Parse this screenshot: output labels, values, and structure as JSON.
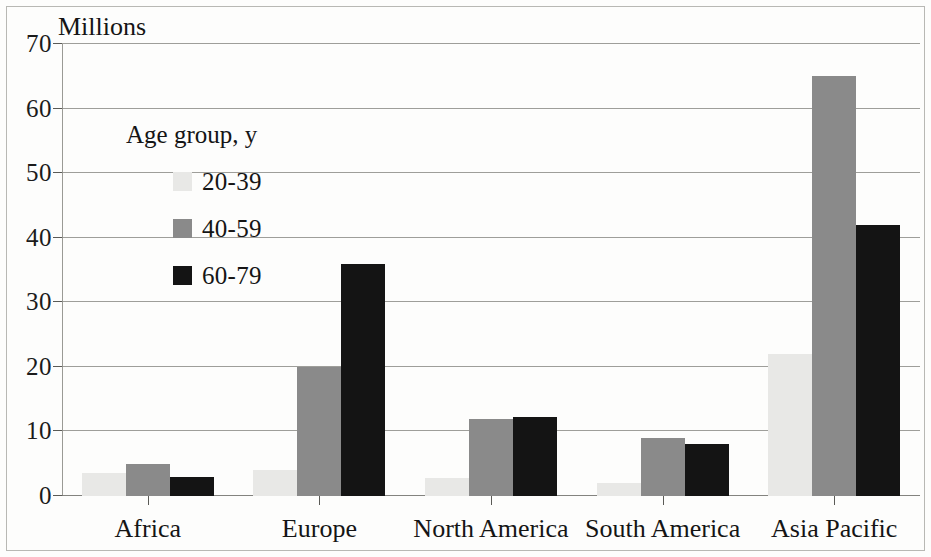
{
  "chart_data": {
    "type": "bar",
    "title": "",
    "ylabel": "Millions",
    "xlabel": "",
    "ylim": [
      0,
      70
    ],
    "yticks": [
      0,
      10,
      20,
      30,
      40,
      50,
      60,
      70
    ],
    "grid": true,
    "legend_position": "inside-upper-left",
    "legend_title": "Age group, y",
    "categories": [
      "Africa",
      "Europe",
      "North America",
      "South America",
      "Asia Pacific"
    ],
    "series": [
      {
        "name": "20-39",
        "color": "#e8e8e6",
        "values": [
          3.5,
          4,
          2.8,
          2,
          22
        ]
      },
      {
        "name": "40-59",
        "color": "#8a8a8a",
        "values": [
          5,
          20,
          12,
          9,
          65
        ]
      },
      {
        "name": "60-79",
        "color": "#141414",
        "values": [
          3,
          36,
          12.2,
          8,
          42
        ]
      }
    ]
  },
  "axis": {
    "unit_label": "Millions",
    "tick_labels": [
      "70",
      "60",
      "50",
      "40",
      "30",
      "20",
      "10",
      "0"
    ]
  },
  "legend": {
    "title": "Age group, y",
    "items": [
      {
        "label": "20-39",
        "color": "#e8e8e6"
      },
      {
        "label": "40-59",
        "color": "#8a8a8a"
      },
      {
        "label": "60-79",
        "color": "#141414"
      }
    ]
  },
  "categories": [
    "Africa",
    "Europe",
    "North America",
    "South America",
    "Asia Pacific"
  ]
}
